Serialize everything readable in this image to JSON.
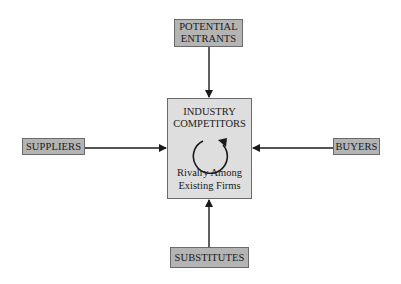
{
  "diagram": {
    "colors": {
      "outer_fill": "#b4b4b4",
      "center_fill": "#dedede",
      "border": "#6a6a6a",
      "arrow": "#1a1a1a"
    },
    "nodes": {
      "potential_entrants": {
        "line1": "POTENTIAL",
        "line2": "ENTRANTS"
      },
      "industry": {
        "title_line1": "INDUSTRY",
        "title_line2": "COMPETITORS",
        "sub_line1": "Rivalry Among",
        "sub_line2": "Existing Firms",
        "icon": "circular-arrow-icon"
      },
      "suppliers": {
        "label": "SUPPLIERS"
      },
      "buyers": {
        "label": "BUYERS"
      },
      "substitutes": {
        "label": "SUBSTITUTES"
      }
    },
    "edges": [
      {
        "from": "potential_entrants",
        "to": "industry"
      },
      {
        "from": "suppliers",
        "to": "industry"
      },
      {
        "from": "buyers",
        "to": "industry"
      },
      {
        "from": "substitutes",
        "to": "industry"
      }
    ]
  }
}
